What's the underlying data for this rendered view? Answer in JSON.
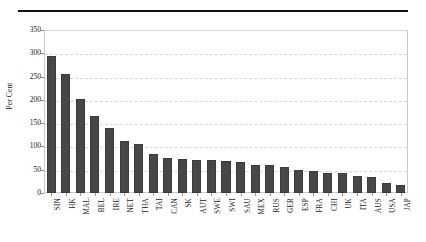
{
  "figure": {
    "top_rule": "horizontal-rule",
    "bar_color": "#474747",
    "grid_color": "#d8d8d8",
    "axis_color": "#c9c9c9"
  },
  "chart_data": {
    "type": "bar",
    "title": "",
    "xlabel": "",
    "ylabel": "Per Cent",
    "ylim": [
      0,
      350
    ],
    "yticks": [
      0,
      50,
      100,
      150,
      200,
      250,
      300,
      350
    ],
    "ytick_labels": [
      "0",
      "50",
      "100",
      "150",
      "200",
      "250",
      "300",
      "350"
    ],
    "grid": true,
    "grid_axis": "y",
    "legend": null,
    "categories": [
      "SIN",
      "HK",
      "MAL",
      "BEL",
      "IRE",
      "NET",
      "THA",
      "TAI",
      "CAN",
      "SK",
      "AUT",
      "SWE",
      "SWI",
      "SAU",
      "MEX",
      "RUS",
      "GER",
      "ESP",
      "FRA",
      "CHI",
      "UK",
      "ITA",
      "AUS",
      "USA",
      "JAP"
    ],
    "values": [
      295,
      255,
      201,
      166,
      139,
      112,
      106,
      83,
      76,
      73,
      70,
      70,
      68,
      66,
      61,
      60,
      56,
      49,
      47,
      44,
      44,
      37,
      35,
      22,
      18
    ]
  }
}
